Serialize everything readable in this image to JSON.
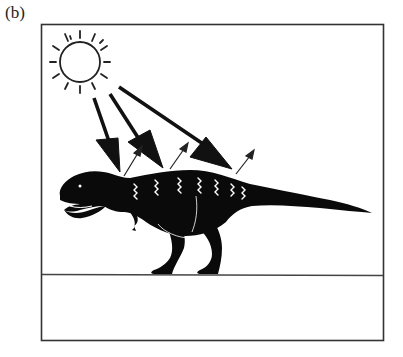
{
  "figure": {
    "panel_label": "(b)",
    "elements": {
      "sun": "sun-icon",
      "incoming_radiation_arrows": 3,
      "outgoing_radiation_arrows": 3,
      "body_heat_waves": 7,
      "animal": "dinosaur-silhouette",
      "ground_line": true
    },
    "colors": {
      "ink": "#111111",
      "frame": "#333333",
      "background": "#ffffff"
    }
  }
}
